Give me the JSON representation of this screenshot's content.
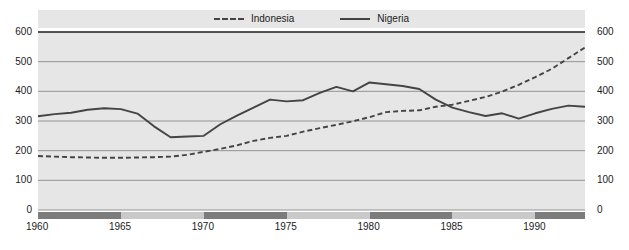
{
  "chart_data": {
    "type": "line",
    "title": "",
    "subtitle": "",
    "xlabel": "",
    "ylabel": "",
    "grid": true,
    "legend_position": "top-center",
    "xlim": [
      1960,
      1993
    ],
    "ylim": [
      0,
      600
    ],
    "x_ticks": [
      1960,
      1965,
      1970,
      1975,
      1980,
      1985,
      1990
    ],
    "y_ticks": [
      0,
      100,
      200,
      300,
      400,
      500,
      600
    ],
    "y_ticks_right": [
      0,
      100,
      200,
      300,
      400,
      500,
      600
    ],
    "x": [
      1960,
      1961,
      1962,
      1963,
      1964,
      1965,
      1966,
      1967,
      1968,
      1969,
      1970,
      1971,
      1972,
      1973,
      1974,
      1975,
      1976,
      1977,
      1978,
      1979,
      1980,
      1981,
      1982,
      1983,
      1984,
      1985,
      1986,
      1987,
      1988,
      1989,
      1990,
      1991,
      1992,
      1993
    ],
    "series": [
      {
        "name": "Indonesia",
        "style": "dashed",
        "color": "#444444",
        "values": [
          182,
          180,
          178,
          177,
          176,
          176,
          177,
          178,
          180,
          186,
          196,
          206,
          218,
          233,
          243,
          250,
          264,
          276,
          287,
          299,
          313,
          330,
          334,
          336,
          348,
          355,
          368,
          381,
          399,
          422,
          448,
          476,
          512,
          548
        ]
      },
      {
        "name": "Nigeria",
        "style": "solid",
        "color": "#444444",
        "values": [
          316,
          323,
          328,
          338,
          343,
          340,
          325,
          282,
          245,
          248,
          250,
          289,
          318,
          345,
          372,
          366,
          370,
          395,
          415,
          400,
          430,
          424,
          418,
          408,
          372,
          345,
          330,
          317,
          326,
          308,
          326,
          341,
          352,
          348
        ]
      }
    ]
  },
  "legend": {
    "entries": [
      {
        "label": "Indonesia",
        "style": "dashed"
      },
      {
        "label": "Nigeria",
        "style": "solid"
      }
    ]
  },
  "axis_bands": [
    {
      "start": 1960,
      "end": 1965,
      "shade": "dark"
    },
    {
      "start": 1965,
      "end": 1970,
      "shade": "light"
    },
    {
      "start": 1970,
      "end": 1975,
      "shade": "dark"
    },
    {
      "start": 1975,
      "end": 1980,
      "shade": "light"
    },
    {
      "start": 1980,
      "end": 1985,
      "shade": "dark"
    },
    {
      "start": 1985,
      "end": 1990,
      "shade": "light"
    },
    {
      "start": 1990,
      "end": 1993,
      "shade": "dark"
    }
  ],
  "colors": {
    "plot_background": "#e6e6e6",
    "line": "#444444",
    "gridline": "#8a8a8a",
    "axis_band_dark": "#7c7c7c",
    "axis_band_light": "#c9c9c9",
    "text": "#1b1b1b"
  }
}
